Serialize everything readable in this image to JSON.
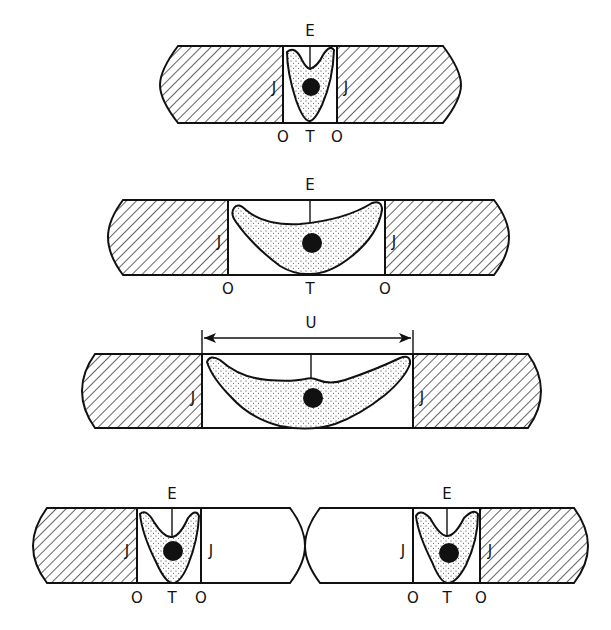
{
  "diagram": {
    "type": "schematic cross-sections of cell in junction gaps",
    "panels": [
      {
        "id": "panel-1",
        "labels": {
          "top": "E",
          "sides": [
            "J",
            "J"
          ],
          "bottom": [
            "O",
            "T",
            "O"
          ]
        },
        "gap": "narrow",
        "cell_shape": "V"
      },
      {
        "id": "panel-2",
        "labels": {
          "top": "E",
          "sides": [
            "J",
            "J"
          ],
          "bottom": [
            "O",
            "T",
            "O"
          ]
        },
        "gap": "wide",
        "cell_shape": "crescent"
      },
      {
        "id": "panel-3",
        "labels": {
          "top": "U",
          "sides": [
            "J",
            "J"
          ]
        },
        "gap": "widest",
        "cell_shape": "spread",
        "dimension_arrow": "U"
      },
      {
        "id": "panel-4-left",
        "labels": {
          "top": "E",
          "sides": [
            "J",
            "J"
          ],
          "bottom": [
            "O",
            "T",
            "O"
          ]
        },
        "gap": "narrow",
        "cell_shape": "V"
      },
      {
        "id": "panel-4-right",
        "labels": {
          "top": "E",
          "sides": [
            "J",
            "J"
          ],
          "bottom": [
            "O",
            "T",
            "O"
          ]
        },
        "gap": "narrow",
        "cell_shape": "V"
      }
    ]
  },
  "labels": {
    "E": "E",
    "J": "J",
    "O": "O",
    "T": "T",
    "U": "U"
  },
  "colors": {
    "ink": "#111111",
    "background": "#ffffff"
  }
}
